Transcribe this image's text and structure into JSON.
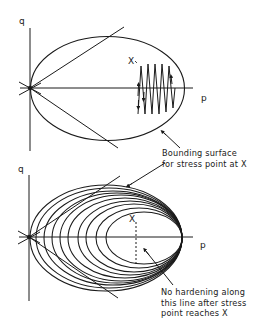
{
  "top_panel": {
    "axis_labels": {
      "q": "q",
      "p": "p"
    },
    "point_label": "X",
    "annotation": {
      "lines": [
        "Bounding surface",
        "for stress point at X"
      ]
    }
  },
  "bottom_panel": {
    "axis_labels": {
      "q": "q",
      "p": "p"
    },
    "point_label": "X",
    "annotation": {
      "lines": [
        "No hardening along",
        "this line after stress",
        "point reaches X"
      ]
    }
  },
  "colors": {
    "ink": "#1a1a1a",
    "background": "#ffffff"
  }
}
